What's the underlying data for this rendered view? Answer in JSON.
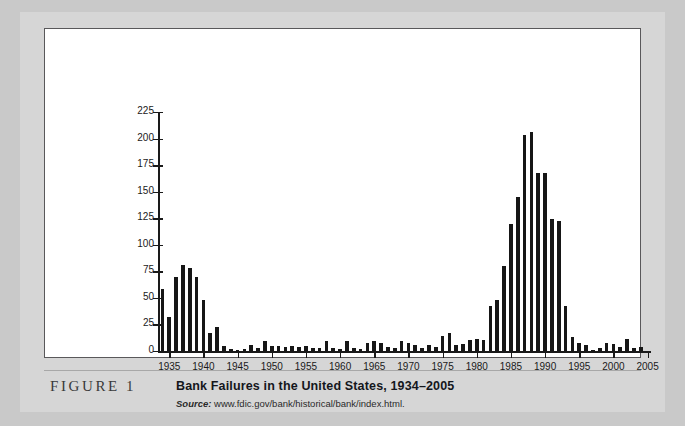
{
  "figure": {
    "tag": "FIGURE 1",
    "title": "Bank Failures in the United States, 1934–2005",
    "source_word": "Source:",
    "source_url": "www.fdic.gov/bank/historical/bank/index.html."
  },
  "colors": {
    "page_background": "#c9c9c9",
    "card_background": "#d6d6d6",
    "plot_background": "#ffffff",
    "plot_border": "#59585a",
    "bar": "#161616",
    "axis": "#1a1a1a"
  },
  "chart_data": {
    "type": "bar",
    "title": "Bank Failures in the United States, 1934–2005",
    "xlabel": "",
    "ylabel": "Number of Bank Failures",
    "ylim": [
      0,
      225
    ],
    "ytick_values": [
      0,
      25,
      50,
      75,
      100,
      125,
      150,
      175,
      200,
      225
    ],
    "ytick_labels": [
      "0",
      "25",
      "50",
      "75",
      "100",
      "125",
      "150",
      "175",
      "200",
      "225"
    ],
    "xtick_labels": [
      "1935",
      "1940",
      "1945",
      "1950",
      "1955",
      "1960",
      "1965",
      "1970",
      "1975",
      "1980",
      "1985",
      "1990",
      "1995",
      "2000",
      "2005"
    ],
    "xlim": [
      1934,
      2005
    ],
    "grid": false,
    "legend": null,
    "categories": [
      "1934",
      "1935",
      "1936",
      "1937",
      "1938",
      "1939",
      "1940",
      "1941",
      "1942",
      "1943",
      "1944",
      "1945",
      "1946",
      "1947",
      "1948",
      "1949",
      "1950",
      "1951",
      "1952",
      "1953",
      "1954",
      "1955",
      "1956",
      "1957",
      "1958",
      "1959",
      "1960",
      "1961",
      "1962",
      "1963",
      "1964",
      "1965",
      "1966",
      "1967",
      "1968",
      "1969",
      "1970",
      "1971",
      "1972",
      "1973",
      "1974",
      "1975",
      "1976",
      "1977",
      "1978",
      "1979",
      "1980",
      "1981",
      "1982",
      "1983",
      "1984",
      "1985",
      "1986",
      "1987",
      "1988",
      "1989",
      "1990",
      "1991",
      "1992",
      "1993",
      "1994",
      "1995",
      "1996",
      "1997",
      "1998",
      "1999",
      "2000",
      "2001",
      "2002",
      "2003",
      "2004",
      "2005"
    ],
    "values": [
      58,
      32,
      70,
      81,
      78,
      70,
      48,
      17,
      23,
      5,
      2,
      1,
      2,
      6,
      3,
      9,
      5,
      5,
      4,
      5,
      4,
      5,
      3,
      3,
      9,
      3,
      2,
      9,
      3,
      2,
      8,
      9,
      8,
      4,
      3,
      9,
      8,
      6,
      3,
      6,
      4,
      14,
      17,
      6,
      7,
      10,
      11,
      10,
      42,
      48,
      80,
      120,
      145,
      203,
      206,
      168,
      168,
      124,
      122,
      42,
      13,
      8,
      6,
      1,
      3,
      8,
      7,
      4,
      11,
      3,
      4,
      0
    ]
  }
}
